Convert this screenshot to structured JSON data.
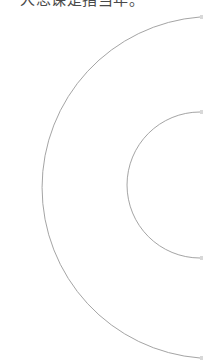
{
  "caption": {
    "text": "人思课是指当年。"
  },
  "diagram": {
    "stroke_color": "#9a9a9a",
    "tick_color": "#d0d0d0",
    "outer_arc": {
      "cx": 200,
      "cy": 188,
      "r": 171
    },
    "inner_arc": {
      "cx": 200,
      "cy": 185,
      "r": 73
    }
  }
}
